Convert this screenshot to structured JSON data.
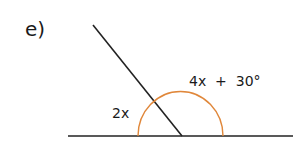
{
  "problem": {
    "label": "e)"
  },
  "diagram": {
    "angle_left_label": "2x",
    "angle_right_label": "4x  +  30°",
    "line_color": "#222222",
    "arc_color": "#e0873a"
  }
}
